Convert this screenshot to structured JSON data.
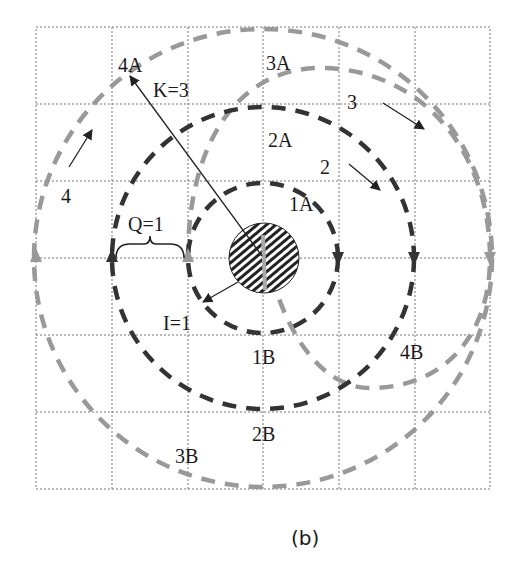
{
  "figure": {
    "caption": "(b)",
    "grid": {
      "rows": 6,
      "cols": 6
    },
    "center_object": "hatched-disk",
    "labels": {
      "ring1_top": "1A",
      "ring1_bottom": "1B",
      "ring2_top": "2A",
      "ring2_bottom": "2B",
      "ring3_top": "3A",
      "ring3_bottom": "3B",
      "ring4_top": "4A",
      "ring4_bottom": "4B",
      "arrow2": "2",
      "arrow3": "3",
      "arrow4": "4",
      "radius_label": "K=3",
      "spacing_label": "Q=1",
      "increment_label": "I=1"
    },
    "colors": {
      "dark_ring": "#333333",
      "grey_ring": "#999999",
      "grid": "#777777"
    }
  }
}
